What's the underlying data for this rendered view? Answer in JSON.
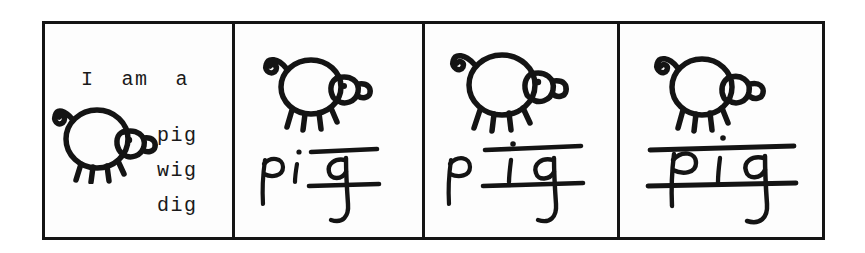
{
  "sheet": {
    "kind": "scanned-worksheet",
    "ink_color": "#141414",
    "paper_color": "#fdfdfd",
    "page_background": "#ffffff"
  },
  "comic": {
    "panel_count": 4,
    "panels": [
      {
        "index": 1,
        "name": "panel-sentence-and-wordlist",
        "sentence": "I  am  a",
        "word_list": [
          "pig",
          "wig",
          "dig"
        ],
        "drawing": "pig-drawing",
        "handwritten_word": "",
        "boxed_part": ""
      },
      {
        "index": 2,
        "name": "panel-boxed-g",
        "sentence": "",
        "word_list": [],
        "drawing": "pig-drawing",
        "handwritten_word": "pig",
        "unboxed_part": "pi",
        "boxed_part": "g"
      },
      {
        "index": 3,
        "name": "panel-boxed-ig",
        "sentence": "",
        "word_list": [],
        "drawing": "pig-drawing",
        "handwritten_word": "pig",
        "unboxed_part": "p",
        "boxed_part": "ig"
      },
      {
        "index": 4,
        "name": "panel-boxed-pig",
        "sentence": "",
        "word_list": [],
        "drawing": "pig-drawing",
        "handwritten_word": "pig",
        "unboxed_part": "",
        "boxed_part": "pig"
      }
    ]
  }
}
